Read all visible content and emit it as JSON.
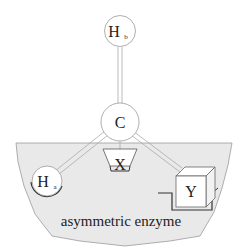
{
  "diagram": {
    "type": "three-point attachment model",
    "colors": {
      "enzyme_fill": "#e9e9e9",
      "enzyme_stroke": "#9a9a9a",
      "atom_fill": "#ffffff",
      "atom_stroke": "#999999",
      "bond": "#aaaaaa",
      "site_stroke": "#333333"
    },
    "atoms": {
      "hb": {
        "label": "H",
        "subscript": "b"
      },
      "c": {
        "label": "C"
      },
      "ha": {
        "label": "H",
        "subscript": "a"
      },
      "x": {
        "label": "X"
      },
      "y": {
        "label": "Y"
      }
    },
    "enzyme": {
      "label": "asymmetric enzyme"
    }
  }
}
